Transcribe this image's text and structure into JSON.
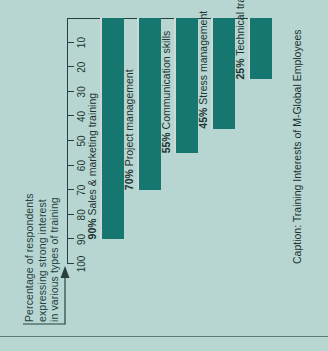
{
  "figure": {
    "caption": "Caption: Training Interests of M-Global Employees",
    "axis_title_lines": [
      "Percentage of respondents",
      "expressing strong interest",
      "in various types of training"
    ],
    "arrow_icon": "axis-pointer-arrow-icon",
    "colors": {
      "background": "#b7d6d1",
      "bar": "#15776f",
      "bar_highlight": "#cfd8d4",
      "axis": "#27403f",
      "text": "#1d3230"
    }
  },
  "chart_data": {
    "type": "bar",
    "orientation": "horizontal",
    "title": "Caption: Training Interests of M-Global Employees",
    "xlabel": "Percentage of respondents expressing strong interest in various types of training",
    "ylabel": "",
    "xlim": [
      0,
      100
    ],
    "grid": false,
    "legend": "none",
    "tick_labels": [
      "100",
      "90",
      "80",
      "70",
      "60",
      "50",
      "40",
      "30",
      "20",
      "10"
    ],
    "ticks": [
      100,
      90,
      80,
      70,
      60,
      50,
      40,
      30,
      20,
      10
    ],
    "categories": [
      "Sales & marketing training",
      "Project management",
      "Communication skills",
      "Stress management",
      "Technical training"
    ],
    "values": [
      90,
      70,
      55,
      45,
      25
    ],
    "data_labels": [
      "90% Sales & marketing training",
      "70% Project management",
      "55% Communication skills",
      "45% Stress management",
      "25% Technical training"
    ],
    "bars": [
      {
        "pct": "90%",
        "name": "Sales & marketing training",
        "value": 90
      },
      {
        "pct": "70%",
        "name": "Project management",
        "value": 70
      },
      {
        "pct": "55%",
        "name": "Communication skills",
        "value": 55
      },
      {
        "pct": "45%",
        "name": "Stress management",
        "value": 45
      },
      {
        "pct": "25%",
        "name": "Technical training",
        "value": 25
      }
    ]
  }
}
